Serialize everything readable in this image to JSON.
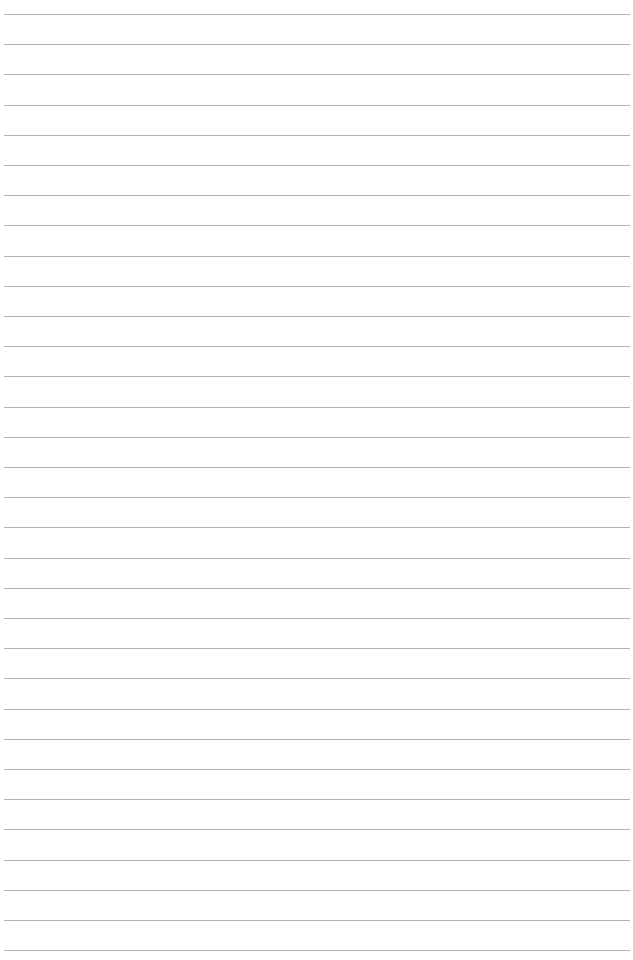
{
  "page": {
    "type": "lined-paper",
    "background_color": "#ffffff",
    "line_color": "#b3b3b3",
    "line_count": 32,
    "first_line_y": 14,
    "line_spacing": 30.2
  }
}
